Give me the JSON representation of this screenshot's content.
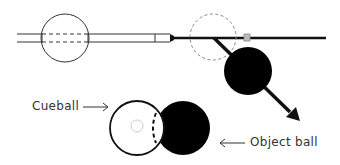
{
  "labels": {
    "cueball": "Cueball",
    "object_ball": "Object ball"
  },
  "colors": {
    "line": "#111111",
    "ghost": "#888888",
    "square": "#aaaaaa",
    "text": "#333333"
  }
}
